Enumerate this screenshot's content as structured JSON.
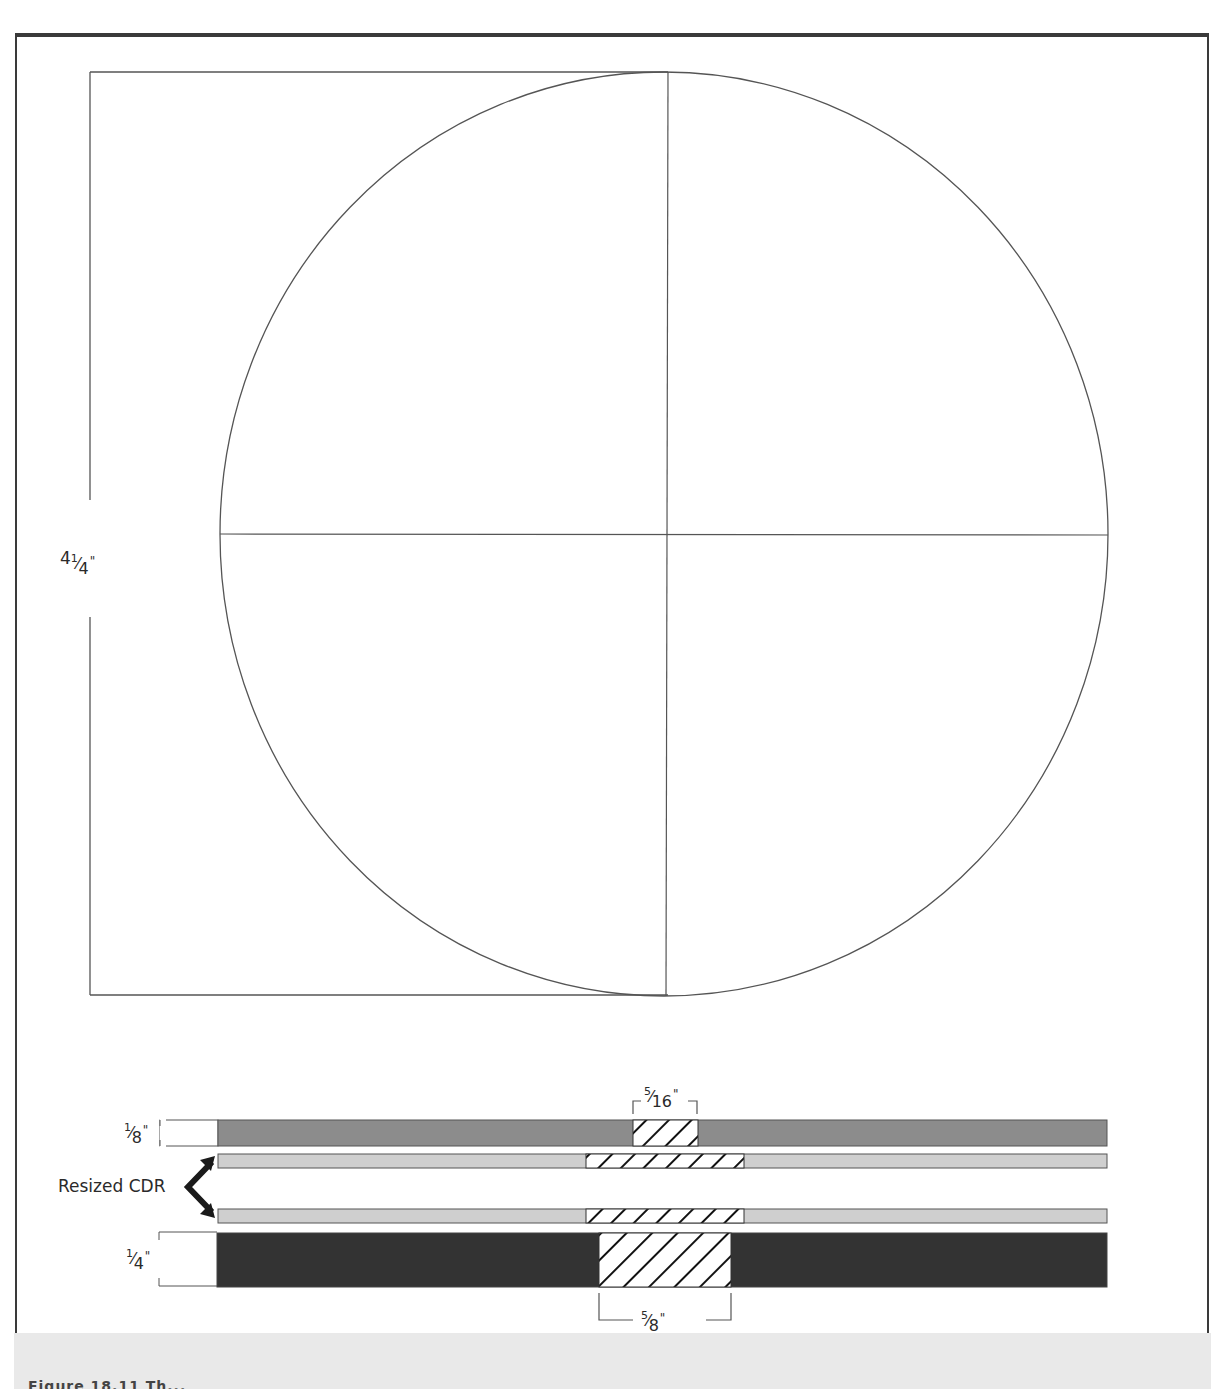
{
  "figure": {
    "caption_fragment": "Figure 18.11 Th..."
  },
  "dimensions": {
    "height_label": {
      "whole": "4",
      "num": "1",
      "den": "4",
      "unit": "\""
    },
    "thin_strip_label": {
      "num": "1",
      "den": "8",
      "unit": "\""
    },
    "thick_strip_label": {
      "num": "1",
      "den": "4",
      "unit": "\""
    },
    "top_gap_label": {
      "num": "5",
      "den": "16",
      "unit": "\""
    },
    "bottom_gap_label": {
      "num": "5",
      "den": "8",
      "unit": "\""
    }
  },
  "annotations": {
    "resized_label": "Resized CDR"
  },
  "colors": {
    "frame": "#3a3a3a",
    "line": "#555555",
    "strip_medium": "#8c8c8c",
    "strip_light": "#cfcfcf",
    "strip_dark": "#333333",
    "hatch": "#111111",
    "caption_bg": "#e9e9e9"
  }
}
